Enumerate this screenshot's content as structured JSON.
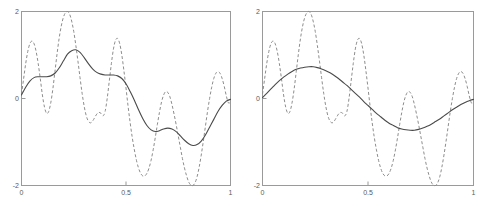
{
  "figure": {
    "background_color": "#ffffff",
    "panel_count": 2
  },
  "axes": {
    "x_label_0": "0",
    "x_label_mid": "0.5",
    "x_label_1": "1",
    "y_label_top": "2",
    "y_label_mid": "0",
    "y_label_bottom": "-2"
  },
  "style": {
    "frame_color": "#9a9a9a",
    "signal_color": "#8d8d8d",
    "approx_color": "#4a4a4a",
    "tick_label_color": "#5a5a5a"
  },
  "chart_data": [
    {
      "type": "line",
      "title": "",
      "xlabel": "",
      "ylabel": "",
      "xlim": [
        0,
        1
      ],
      "ylim": [
        -2,
        2
      ],
      "xticks": [
        0,
        0.5,
        1
      ],
      "xticklabels": [
        "0",
        "0.5",
        "1"
      ],
      "yticks": [
        -2,
        0,
        2
      ],
      "yticklabels": [
        "-2",
        "0",
        "2"
      ],
      "grid": false,
      "legend": "none",
      "panel": "left",
      "series": [
        {
          "name": "signal",
          "style": "dashed",
          "color": "#8d8d8d",
          "x": [
            0.0,
            0.01,
            0.02,
            0.03,
            0.04,
            0.05,
            0.06,
            0.07,
            0.08,
            0.09,
            0.1,
            0.11,
            0.12,
            0.13,
            0.14,
            0.15,
            0.16,
            0.17,
            0.18,
            0.19,
            0.2,
            0.21,
            0.22,
            0.23,
            0.24,
            0.25,
            0.26,
            0.27,
            0.28,
            0.29,
            0.3,
            0.31,
            0.32,
            0.33,
            0.34,
            0.35,
            0.36,
            0.37,
            0.38,
            0.39,
            0.4,
            0.41,
            0.42,
            0.43,
            0.44,
            0.45,
            0.46,
            0.47,
            0.48,
            0.49,
            0.5,
            0.51,
            0.52,
            0.53,
            0.54,
            0.55,
            0.56,
            0.57,
            0.58,
            0.59,
            0.6,
            0.61,
            0.62,
            0.63,
            0.64,
            0.65,
            0.66,
            0.67,
            0.68,
            0.69,
            0.7,
            0.71,
            0.72,
            0.73,
            0.74,
            0.75,
            0.76,
            0.77,
            0.78,
            0.79,
            0.8,
            0.81,
            0.82,
            0.83,
            0.84,
            0.85,
            0.86,
            0.87,
            0.88,
            0.89,
            0.9,
            0.91,
            0.92,
            0.93,
            0.94,
            0.95,
            0.96,
            0.97,
            0.98,
            0.99,
            1.0
          ],
          "y": [
            0.1,
            0.45,
            0.8,
            1.08,
            1.26,
            1.32,
            1.26,
            1.08,
            0.8,
            0.45,
            0.08,
            -0.2,
            -0.34,
            -0.3,
            -0.1,
            0.22,
            0.62,
            1.02,
            1.38,
            1.66,
            1.86,
            1.97,
            2.0,
            1.94,
            1.78,
            1.54,
            1.22,
            0.86,
            0.48,
            0.12,
            -0.18,
            -0.4,
            -0.52,
            -0.56,
            -0.52,
            -0.44,
            -0.36,
            -0.32,
            -0.34,
            -0.4,
            -0.3,
            0.0,
            0.4,
            0.8,
            1.14,
            1.34,
            1.38,
            1.26,
            1.0,
            0.64,
            0.24,
            -0.18,
            -0.56,
            -0.9,
            -1.18,
            -1.42,
            -1.6,
            -1.72,
            -1.78,
            -1.78,
            -1.72,
            -1.6,
            -1.42,
            -1.18,
            -0.9,
            -0.6,
            -0.32,
            -0.08,
            0.08,
            0.16,
            0.14,
            0.04,
            -0.14,
            -0.36,
            -0.6,
            -0.86,
            -1.12,
            -1.38,
            -1.6,
            -1.78,
            -1.92,
            -1.99,
            -2.0,
            -1.94,
            -1.8,
            -1.58,
            -1.3,
            -0.98,
            -0.64,
            -0.3,
            0.0,
            0.26,
            0.46,
            0.58,
            0.62,
            0.58,
            0.46,
            0.28,
            0.06,
            -0.1,
            -0.08
          ]
        },
        {
          "name": "approximation",
          "style": "solid",
          "color": "#4a4a4a",
          "x": [
            0.0,
            0.02,
            0.04,
            0.06,
            0.08,
            0.1,
            0.12,
            0.14,
            0.16,
            0.18,
            0.2,
            0.22,
            0.24,
            0.26,
            0.28,
            0.3,
            0.32,
            0.34,
            0.36,
            0.38,
            0.4,
            0.42,
            0.44,
            0.46,
            0.48,
            0.5,
            0.52,
            0.54,
            0.56,
            0.58,
            0.6,
            0.62,
            0.64,
            0.66,
            0.68,
            0.7,
            0.72,
            0.74,
            0.76,
            0.78,
            0.8,
            0.82,
            0.84,
            0.86,
            0.88,
            0.9,
            0.92,
            0.94,
            0.96,
            0.98,
            1.0
          ],
          "y": [
            0.08,
            0.26,
            0.4,
            0.48,
            0.5,
            0.5,
            0.5,
            0.52,
            0.58,
            0.7,
            0.86,
            1.02,
            1.1,
            1.12,
            1.06,
            0.94,
            0.8,
            0.68,
            0.6,
            0.56,
            0.54,
            0.54,
            0.54,
            0.52,
            0.46,
            0.34,
            0.16,
            -0.04,
            -0.26,
            -0.46,
            -0.62,
            -0.72,
            -0.76,
            -0.74,
            -0.7,
            -0.68,
            -0.7,
            -0.76,
            -0.86,
            -0.96,
            -1.04,
            -1.08,
            -1.06,
            -0.98,
            -0.84,
            -0.66,
            -0.48,
            -0.3,
            -0.16,
            -0.06,
            -0.02
          ]
        }
      ]
    },
    {
      "type": "line",
      "title": "",
      "xlabel": "",
      "ylabel": "",
      "xlim": [
        0,
        1
      ],
      "ylim": [
        -2,
        2
      ],
      "xticks": [
        0,
        0.5,
        1
      ],
      "xticklabels": [
        "0",
        "0.5",
        "1"
      ],
      "yticks": [
        -2,
        0,
        2
      ],
      "yticklabels": [
        "-2",
        "0",
        "2"
      ],
      "grid": false,
      "legend": "none",
      "panel": "right",
      "series": [
        {
          "name": "signal",
          "style": "dashed",
          "color": "#8d8d8d",
          "x": [
            0.0,
            0.01,
            0.02,
            0.03,
            0.04,
            0.05,
            0.06,
            0.07,
            0.08,
            0.09,
            0.1,
            0.11,
            0.12,
            0.13,
            0.14,
            0.15,
            0.16,
            0.17,
            0.18,
            0.19,
            0.2,
            0.21,
            0.22,
            0.23,
            0.24,
            0.25,
            0.26,
            0.27,
            0.28,
            0.29,
            0.3,
            0.31,
            0.32,
            0.33,
            0.34,
            0.35,
            0.36,
            0.37,
            0.38,
            0.39,
            0.4,
            0.41,
            0.42,
            0.43,
            0.44,
            0.45,
            0.46,
            0.47,
            0.48,
            0.49,
            0.5,
            0.51,
            0.52,
            0.53,
            0.54,
            0.55,
            0.56,
            0.57,
            0.58,
            0.59,
            0.6,
            0.61,
            0.62,
            0.63,
            0.64,
            0.65,
            0.66,
            0.67,
            0.68,
            0.69,
            0.7,
            0.71,
            0.72,
            0.73,
            0.74,
            0.75,
            0.76,
            0.77,
            0.78,
            0.79,
            0.8,
            0.81,
            0.82,
            0.83,
            0.84,
            0.85,
            0.86,
            0.87,
            0.88,
            0.89,
            0.9,
            0.91,
            0.92,
            0.93,
            0.94,
            0.95,
            0.96,
            0.97,
            0.98,
            0.99,
            1.0
          ],
          "y": [
            0.1,
            0.45,
            0.8,
            1.08,
            1.26,
            1.32,
            1.26,
            1.08,
            0.8,
            0.45,
            0.08,
            -0.2,
            -0.34,
            -0.3,
            -0.1,
            0.22,
            0.62,
            1.02,
            1.38,
            1.66,
            1.86,
            1.97,
            2.0,
            1.94,
            1.78,
            1.54,
            1.22,
            0.86,
            0.48,
            0.12,
            -0.18,
            -0.4,
            -0.52,
            -0.56,
            -0.52,
            -0.44,
            -0.36,
            -0.32,
            -0.34,
            -0.4,
            -0.3,
            0.0,
            0.4,
            0.8,
            1.14,
            1.34,
            1.38,
            1.26,
            1.0,
            0.64,
            0.24,
            -0.18,
            -0.56,
            -0.9,
            -1.18,
            -1.42,
            -1.6,
            -1.72,
            -1.78,
            -1.78,
            -1.72,
            -1.6,
            -1.42,
            -1.18,
            -0.9,
            -0.6,
            -0.32,
            -0.08,
            0.08,
            0.16,
            0.14,
            0.04,
            -0.14,
            -0.36,
            -0.6,
            -0.86,
            -1.12,
            -1.38,
            -1.6,
            -1.78,
            -1.92,
            -1.99,
            -2.0,
            -1.94,
            -1.8,
            -1.58,
            -1.3,
            -0.98,
            -0.64,
            -0.3,
            0.0,
            0.26,
            0.46,
            0.58,
            0.62,
            0.58,
            0.46,
            0.28,
            0.06,
            -0.1,
            -0.08
          ]
        },
        {
          "name": "approximation",
          "style": "solid",
          "color": "#4a4a4a",
          "x": [
            0.0,
            0.02,
            0.04,
            0.06,
            0.08,
            0.1,
            0.12,
            0.14,
            0.16,
            0.18,
            0.2,
            0.22,
            0.24,
            0.26,
            0.28,
            0.3,
            0.32,
            0.34,
            0.36,
            0.38,
            0.4,
            0.42,
            0.44,
            0.46,
            0.48,
            0.5,
            0.52,
            0.54,
            0.56,
            0.58,
            0.6,
            0.62,
            0.64,
            0.66,
            0.68,
            0.7,
            0.72,
            0.74,
            0.76,
            0.78,
            0.8,
            0.82,
            0.84,
            0.86,
            0.88,
            0.9,
            0.92,
            0.94,
            0.96,
            0.98,
            1.0
          ],
          "y": [
            0.02,
            0.12,
            0.22,
            0.32,
            0.41,
            0.49,
            0.56,
            0.62,
            0.67,
            0.7,
            0.72,
            0.73,
            0.73,
            0.71,
            0.68,
            0.64,
            0.59,
            0.53,
            0.46,
            0.38,
            0.3,
            0.21,
            0.12,
            0.03,
            -0.07,
            -0.16,
            -0.25,
            -0.34,
            -0.42,
            -0.5,
            -0.57,
            -0.62,
            -0.67,
            -0.7,
            -0.72,
            -0.73,
            -0.73,
            -0.71,
            -0.68,
            -0.64,
            -0.59,
            -0.53,
            -0.47,
            -0.4,
            -0.33,
            -0.26,
            -0.2,
            -0.14,
            -0.09,
            -0.05,
            -0.02
          ]
        }
      ]
    }
  ]
}
